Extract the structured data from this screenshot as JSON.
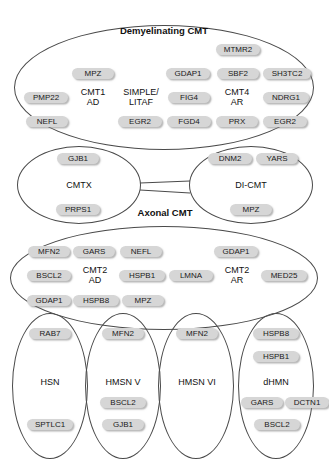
{
  "figure": {
    "title_demyelinating": "Demyelinating CMT",
    "title_axonal": "Axonal CMT"
  },
  "groups": {
    "demyelinating": {
      "label": "Demyelinating CMT",
      "subgroups": [
        {
          "name": "CMT1 AD",
          "label_line1": "CMT1",
          "label_line2": "AD",
          "genes": [
            "PMP22",
            "MPZ",
            "NEFL"
          ]
        },
        {
          "name": "SIMPLE/LITAF",
          "label_line1": "SIMPLE/",
          "label_line2": "LITAF",
          "genes": [
            "EGR2"
          ]
        },
        {
          "name": "CMT4 AR",
          "label_line1": "CMT4",
          "label_line2": "AR",
          "genes": [
            "MTMR2",
            "GDAP1",
            "SBF2",
            "SH3TC2",
            "FIG4",
            "NDRG1",
            "FGD4",
            "PRX",
            "EGR2"
          ]
        }
      ],
      "genes": [
        "MTMR2",
        "MPZ",
        "GDAP1",
        "SBF2",
        "SH3TC2",
        "PMP22",
        "FIG4",
        "NDRG1",
        "NEFL",
        "EGR2",
        "FGD4",
        "PRX",
        "EGR2"
      ]
    },
    "cmtx": {
      "label": "CMTX",
      "genes": [
        "GJB1",
        "PRPS1"
      ]
    },
    "dicmt": {
      "label": "DI-CMT",
      "genes": [
        "DNM2",
        "YARS",
        "MPZ"
      ]
    },
    "axonal": {
      "label": "Axonal CMT",
      "subgroups": [
        {
          "name": "CMT2 AD",
          "label_line1": "CMT2",
          "label_line2": "AD",
          "genes": [
            "MFN2",
            "GARS",
            "NEFL",
            "BSCL2",
            "HSPB1",
            "GDAP1",
            "HSPB8",
            "MPZ"
          ]
        },
        {
          "name": "CMT2 AR",
          "label_line1": "CMT2",
          "label_line2": "AR",
          "genes": [
            "GDAP1",
            "LMNA",
            "MED25"
          ]
        }
      ],
      "genes": [
        "MFN2",
        "GARS",
        "NEFL",
        "GDAP1",
        "BSCL2",
        "HSPB1",
        "LMNA",
        "MED25",
        "GDAP1",
        "HSPB8",
        "MPZ"
      ]
    },
    "hsn": {
      "label": "HSN",
      "genes": [
        "RAB7",
        "SPTLC1"
      ]
    },
    "hmsn_v": {
      "label": "HMSN V",
      "genes": [
        "MFN2",
        "BSCL2",
        "GJB1"
      ]
    },
    "hmsn_vi": {
      "label": "HMSN VI",
      "genes": [
        "MFN2"
      ]
    },
    "dhmn": {
      "label": "dHMN",
      "genes": [
        "HSPB8",
        "HSPB1",
        "GARS",
        "DCTN1",
        "BSCL2"
      ]
    }
  },
  "nodes": {
    "demy": [
      {
        "id": "d-mtmr2",
        "text": "MTMR2"
      },
      {
        "id": "d-mpz",
        "text": "MPZ"
      },
      {
        "id": "d-gdap1",
        "text": "GDAP1"
      },
      {
        "id": "d-sbf2",
        "text": "SBF2"
      },
      {
        "id": "d-sh3tc2",
        "text": "SH3TC2"
      },
      {
        "id": "d-pmp22",
        "text": "PMP22"
      },
      {
        "id": "d-cmt1ad",
        "text": "CMT1\nAD"
      },
      {
        "id": "d-simple",
        "text": "SIMPLE/\nLITAF"
      },
      {
        "id": "d-fig4",
        "text": "FIG4"
      },
      {
        "id": "d-cmt4ar",
        "text": "CMT4\nAR"
      },
      {
        "id": "d-ndrg1",
        "text": "NDRG1"
      },
      {
        "id": "d-nefl",
        "text": "NEFL"
      },
      {
        "id": "d-egr2a",
        "text": "EGR2"
      },
      {
        "id": "d-fgd4",
        "text": "FGD4"
      },
      {
        "id": "d-prx",
        "text": "PRX"
      },
      {
        "id": "d-egr2b",
        "text": "EGR2"
      }
    ],
    "cmtx": [
      {
        "id": "x-gjb1",
        "text": "GJB1"
      },
      {
        "id": "x-cmtx",
        "text": "CMTX"
      },
      {
        "id": "x-prps1",
        "text": "PRPS1"
      }
    ],
    "dicmt": [
      {
        "id": "i-dnm2",
        "text": "DNM2"
      },
      {
        "id": "i-yars",
        "text": "YARS"
      },
      {
        "id": "i-dicmt",
        "text": "DI-CMT"
      },
      {
        "id": "i-mpz",
        "text": "MPZ"
      }
    ],
    "axonal": [
      {
        "id": "a-mfn2",
        "text": "MFN2"
      },
      {
        "id": "a-gars",
        "text": "GARS"
      },
      {
        "id": "a-nefl",
        "text": "NEFL"
      },
      {
        "id": "a-gdap1t",
        "text": "GDAP1"
      },
      {
        "id": "a-bscl2",
        "text": "BSCL2"
      },
      {
        "id": "a-cmt2ad",
        "text": "CMT2\nAD"
      },
      {
        "id": "a-hspb1",
        "text": "HSPB1"
      },
      {
        "id": "a-lmna",
        "text": "LMNA"
      },
      {
        "id": "a-cmt2ar",
        "text": "CMT2\nAR"
      },
      {
        "id": "a-med25",
        "text": "MED25"
      },
      {
        "id": "a-gdap1b",
        "text": "GDAP1"
      },
      {
        "id": "a-hspb8",
        "text": "HSPB8"
      },
      {
        "id": "a-mpz",
        "text": "MPZ"
      }
    ],
    "hsn": [
      {
        "id": "h-rab7",
        "text": "RAB7"
      },
      {
        "id": "h-hsn",
        "text": "HSN"
      },
      {
        "id": "h-sptlc1",
        "text": "SPTLC1"
      }
    ],
    "hmsn_v": [
      {
        "id": "v-mfn2",
        "text": "MFN2"
      },
      {
        "id": "v-label",
        "text": "HMSN V"
      },
      {
        "id": "v-bscl2",
        "text": "BSCL2"
      },
      {
        "id": "v-gjb1",
        "text": "GJB1"
      }
    ],
    "hmsn_vi": [
      {
        "id": "w-mfn2",
        "text": "MFN2"
      },
      {
        "id": "w-label",
        "text": "HMSN VI"
      }
    ],
    "dhmn": [
      {
        "id": "m-hspb8",
        "text": "HSPB8"
      },
      {
        "id": "m-hspb1",
        "text": "HSPB1"
      },
      {
        "id": "m-label",
        "text": "dHMN"
      },
      {
        "id": "m-gars",
        "text": "GARS"
      },
      {
        "id": "m-dctn1",
        "text": "DCTN1"
      },
      {
        "id": "m-bscl2",
        "text": "BSCL2"
      }
    ]
  },
  "colors": {
    "pill_fill": "#d6d6d6",
    "pill_text": "#1a1a1a",
    "ellipse_stroke": "#4a4a4a",
    "background": "#ffffff"
  }
}
